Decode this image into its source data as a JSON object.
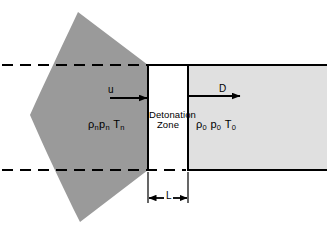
{
  "figure": {
    "name": "detonation-wave-schematic",
    "labels": {
      "zone_line1": "Detonation",
      "zone_line2": "Zone",
      "particle_velocity": "u",
      "detonation_velocity": "D",
      "length_dimension": "L",
      "state_downstream": {
        "density": "ρ",
        "density_sub": "n",
        "pressure": "p",
        "pressure_sub": "n",
        "temperature": "T",
        "temperature_sub": "n"
      },
      "state_upstream": {
        "density": "ρ",
        "density_sub": "0",
        "pressure": "p",
        "pressure_sub": "0",
        "temperature": "T",
        "temperature_sub": "0"
      }
    },
    "colors": {
      "products_fill": "#9a9a9a",
      "unreacted_fill": "#e0e0e0",
      "zone_fill": "#ffffff",
      "line": "#000000",
      "background": "#ffffff"
    },
    "geometry": {
      "zone_left_x": 148,
      "zone_right_x": 188,
      "top_boundary_y": 65,
      "bottom_boundary_y": 170,
      "dimension_line_y": 198,
      "canvas_width": 327,
      "canvas_height": 230
    }
  }
}
